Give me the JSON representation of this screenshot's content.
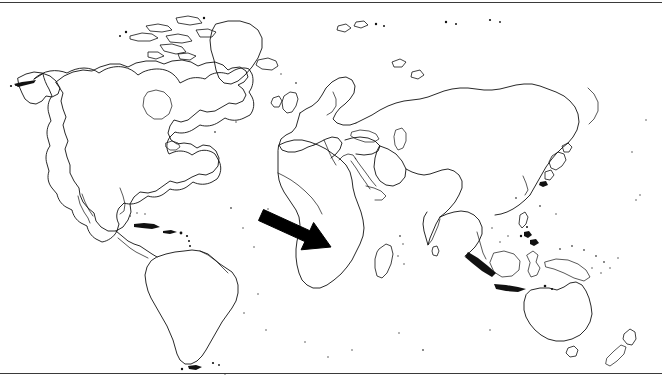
{
  "figure": {
    "kind": "world-outline-map",
    "width": 662,
    "height": 379,
    "background_color": "#ffffff",
    "outline_color": "#111111",
    "has_labels": false,
    "has_graticule": false,
    "has_country_borders": false,
    "projection_style": "miller-cylindrical"
  },
  "frame": {
    "top_rule_color": "#3a3a3a",
    "bottom_rule_color": "#3a3a3a",
    "top_rule_y": 2,
    "bottom_rule_y": 373,
    "left_rule": false,
    "right_rule": false
  },
  "annotation": {
    "type": "arrow",
    "color": "#000000",
    "tail_x": 261,
    "tail_y": 215,
    "tip_x": 331,
    "tip_y": 247,
    "direction": "down-right",
    "points_at": "west-central Africa / Gulf of Guinea coast",
    "label": ""
  },
  "landmasses": [
    {
      "name": "north-america"
    },
    {
      "name": "greenland"
    },
    {
      "name": "south-america"
    },
    {
      "name": "europe"
    },
    {
      "name": "africa"
    },
    {
      "name": "asia"
    },
    {
      "name": "australia"
    },
    {
      "name": "new-zealand"
    },
    {
      "name": "madagascar"
    },
    {
      "name": "indonesia"
    },
    {
      "name": "japan"
    },
    {
      "name": "british-isles"
    },
    {
      "name": "iceland"
    },
    {
      "name": "sri-lanka"
    },
    {
      "name": "caribbean-islands"
    }
  ]
}
